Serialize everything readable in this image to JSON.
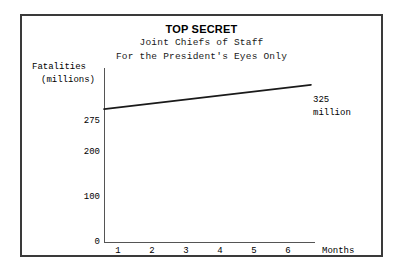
{
  "document": {
    "classification": "TOP SECRET",
    "subtitle_line_1": "Joint Chiefs of Staff",
    "subtitle_line_2": "For the President's Eyes Only"
  },
  "chart_data": {
    "type": "line",
    "title": "TOP SECRET",
    "subtitle": "Joint Chiefs of Staff / For the President's Eyes Only",
    "xlabel": "Months",
    "ylabel_line_1": "Fatalities",
    "ylabel_line_2": "(millions)",
    "x": [
      1,
      2,
      3,
      4,
      5,
      6
    ],
    "values": [
      275,
      285,
      295,
      305,
      315,
      325
    ],
    "x_tick_labels": [
      "1",
      "2",
      "3",
      "4",
      "5",
      "6"
    ],
    "y_tick_labels": [
      "0",
      "100",
      "200",
      "275"
    ],
    "y_tick_values": [
      0,
      100,
      200,
      275
    ],
    "ylim": [
      0,
      360
    ],
    "xlim": [
      0,
      6.8
    ],
    "grid": false,
    "legend": "none",
    "series_color": "#1a1a1a",
    "axis_color": "#555555",
    "annotations": [
      {
        "text_line_1": "325",
        "text_line_2": "million",
        "x": 6,
        "y": 325
      }
    ]
  },
  "colors": {
    "frame": "#3a3a3a",
    "background": "#ffffff",
    "text": "#000000"
  }
}
